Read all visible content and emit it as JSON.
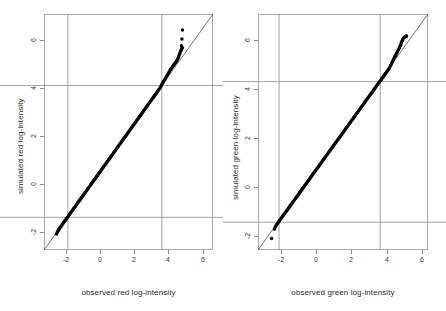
{
  "figure": {
    "width": 446,
    "height": 311,
    "background": "#ffffff",
    "point_color": "#000000",
    "line_color": "#000000",
    "box_color": "#a9a9a9",
    "reference_line_color": "#9a9a9a"
  },
  "chart_data": [
    {
      "type": "scatter",
      "name": "red-qq-plot",
      "title": "",
      "xlabel": "observed red log-intensity",
      "ylabel": "simulated red log-intensity",
      "grid": false,
      "legend": "none",
      "xlim": [
        -2.75,
        7.15
      ],
      "ylim": [
        -2.75,
        7.15
      ],
      "xticks": [
        -2,
        0,
        2,
        4,
        6
      ],
      "yticks": [
        -2,
        0,
        2,
        4,
        6
      ],
      "xticklabels": [
        "-2",
        "0",
        "2",
        "4",
        "6"
      ],
      "yticklabels": [
        "-2",
        "0",
        "2",
        "4",
        "6"
      ],
      "annotations": {
        "identity_line": {
          "from": [
            -2.75,
            -2.75
          ],
          "to": [
            7.15,
            7.15
          ],
          "style": "thin solid"
        },
        "reference_vlines": [
          -1.35,
          4.15
        ],
        "reference_hlines": [
          -1.38,
          4.15
        ]
      },
      "x": [
        -2.02,
        -1.98,
        -1.95,
        -1.92,
        -1.89,
        -1.86,
        -1.83,
        -1.8,
        -1.77,
        -1.74,
        -1.7,
        -1.66,
        -1.62,
        -1.58,
        -1.54,
        -1.5,
        -1.46,
        -1.42,
        -1.38,
        -1.34,
        -1.3,
        -1.26,
        -1.22,
        -1.18,
        -1.14,
        -1.1,
        -1.06,
        -1.02,
        -0.98,
        -0.94,
        -0.9,
        -0.86,
        -0.82,
        -0.78,
        -0.74,
        -0.7,
        -0.66,
        -0.62,
        -0.58,
        -0.54,
        -0.5,
        -0.46,
        -0.42,
        -0.38,
        -0.34,
        -0.3,
        -0.26,
        -0.22,
        -0.18,
        -0.14,
        -0.1,
        -0.06,
        -0.02,
        0.02,
        0.06,
        0.1,
        0.14,
        0.18,
        0.22,
        0.26,
        0.3,
        0.34,
        0.38,
        0.42,
        0.46,
        0.5,
        0.54,
        0.58,
        0.62,
        0.66,
        0.7,
        0.74,
        0.78,
        0.82,
        0.86,
        0.9,
        0.94,
        0.98,
        1.02,
        1.06,
        1.1,
        1.14,
        1.18,
        1.22,
        1.26,
        1.3,
        1.34,
        1.38,
        1.42,
        1.46,
        1.5,
        1.54,
        1.58,
        1.62,
        1.66,
        1.7,
        1.74,
        1.78,
        1.82,
        1.86,
        1.9,
        1.94,
        1.98,
        2.02,
        2.06,
        2.1,
        2.14,
        2.18,
        2.22,
        2.26,
        2.3,
        2.34,
        2.38,
        2.42,
        2.46,
        2.5,
        2.54,
        2.58,
        2.62,
        2.66,
        2.7,
        2.74,
        2.78,
        2.82,
        2.86,
        2.9,
        2.94,
        2.98,
        3.02,
        3.06,
        3.1,
        3.14,
        3.18,
        3.22,
        3.26,
        3.3,
        3.34,
        3.38,
        3.42,
        3.46,
        3.5,
        3.54,
        3.58,
        3.62,
        3.66,
        3.7,
        3.74,
        3.78,
        3.82,
        3.86,
        3.9,
        3.94,
        3.98,
        4.02,
        4.06,
        4.1,
        4.14,
        4.18,
        4.22,
        4.26,
        4.3,
        4.34,
        4.38,
        4.42,
        4.46,
        4.5,
        4.54,
        4.58,
        4.62,
        4.66,
        4.7,
        4.74,
        4.78,
        4.82,
        4.86,
        4.9,
        4.94,
        4.98,
        5.02,
        5.06,
        5.1,
        5.13,
        5.16,
        5.19,
        5.22,
        5.25,
        5.28,
        5.31,
        5.34,
        5.36,
        5.3,
        5.33,
        5.36
      ],
      "y": [
        -2.08,
        -2.02,
        -1.98,
        -1.94,
        -1.9,
        -1.86,
        -1.83,
        -1.8,
        -1.77,
        -1.74,
        -1.7,
        -1.66,
        -1.62,
        -1.58,
        -1.54,
        -1.5,
        -1.46,
        -1.42,
        -1.38,
        -1.34,
        -1.3,
        -1.26,
        -1.22,
        -1.18,
        -1.14,
        -1.1,
        -1.06,
        -1.02,
        -0.98,
        -0.94,
        -0.9,
        -0.86,
        -0.82,
        -0.78,
        -0.74,
        -0.7,
        -0.66,
        -0.62,
        -0.58,
        -0.54,
        -0.5,
        -0.46,
        -0.42,
        -0.38,
        -0.34,
        -0.3,
        -0.26,
        -0.22,
        -0.18,
        -0.14,
        -0.1,
        -0.06,
        -0.02,
        0.02,
        0.06,
        0.1,
        0.14,
        0.18,
        0.22,
        0.26,
        0.3,
        0.34,
        0.38,
        0.42,
        0.46,
        0.5,
        0.54,
        0.58,
        0.62,
        0.66,
        0.7,
        0.74,
        0.78,
        0.82,
        0.86,
        0.9,
        0.94,
        0.98,
        1.02,
        1.06,
        1.1,
        1.14,
        1.18,
        1.22,
        1.26,
        1.3,
        1.34,
        1.38,
        1.42,
        1.46,
        1.5,
        1.54,
        1.58,
        1.62,
        1.66,
        1.7,
        1.74,
        1.78,
        1.82,
        1.86,
        1.9,
        1.94,
        1.98,
        2.02,
        2.06,
        2.1,
        2.14,
        2.18,
        2.22,
        2.26,
        2.3,
        2.34,
        2.38,
        2.42,
        2.46,
        2.5,
        2.54,
        2.58,
        2.62,
        2.66,
        2.7,
        2.74,
        2.78,
        2.82,
        2.86,
        2.9,
        2.94,
        2.98,
        3.02,
        3.06,
        3.1,
        3.14,
        3.18,
        3.22,
        3.26,
        3.3,
        3.34,
        3.38,
        3.42,
        3.46,
        3.5,
        3.54,
        3.58,
        3.62,
        3.66,
        3.7,
        3.74,
        3.78,
        3.82,
        3.86,
        3.9,
        3.94,
        3.98,
        4.02,
        4.07,
        4.12,
        4.17,
        4.22,
        4.27,
        4.32,
        4.37,
        4.42,
        4.47,
        4.52,
        4.57,
        4.62,
        4.67,
        4.72,
        4.77,
        4.82,
        4.86,
        4.9,
        4.94,
        4.98,
        5.02,
        5.06,
        5.1,
        5.14,
        5.18,
        5.22,
        5.28,
        5.34,
        5.4,
        5.46,
        5.52,
        5.58,
        5.63,
        5.68,
        5.72,
        5.74,
        5.82,
        6.1,
        6.48
      ]
    },
    {
      "type": "scatter",
      "name": "green-qq-plot",
      "title": "",
      "xlabel": "observed green log-intensity",
      "ylabel": "simulated green log-intensity",
      "grid": false,
      "legend": "none",
      "xlim": [
        -2.55,
        7.05
      ],
      "ylim": [
        -2.55,
        7.05
      ],
      "xticks": [
        -2,
        0,
        2,
        4,
        6
      ],
      "yticks": [
        -2,
        0,
        2,
        4,
        6
      ],
      "xticklabels": [
        "-2",
        "0",
        "2",
        "4",
        "6"
      ],
      "yticklabels": [
        "-2",
        "0",
        "2",
        "4",
        "6"
      ],
      "annotations": {
        "identity_line": {
          "from": [
            -2.55,
            -2.55
          ],
          "to": [
            7.05,
            7.05
          ],
          "style": "thin solid"
        },
        "reference_vlines": [
          -1.36,
          4.35
        ],
        "reference_hlines": [
          -1.42,
          4.3
        ]
      },
      "x": [
        -1.78,
        -1.62,
        -1.58,
        -1.54,
        -1.5,
        -1.46,
        -1.42,
        -1.38,
        -1.34,
        -1.3,
        -1.26,
        -1.22,
        -1.18,
        -1.14,
        -1.1,
        -1.06,
        -1.02,
        -0.98,
        -0.94,
        -0.9,
        -0.86,
        -0.82,
        -0.78,
        -0.74,
        -0.7,
        -0.66,
        -0.62,
        -0.58,
        -0.54,
        -0.5,
        -0.46,
        -0.42,
        -0.38,
        -0.34,
        -0.3,
        -0.26,
        -0.22,
        -0.18,
        -0.14,
        -0.1,
        -0.06,
        -0.02,
        0.02,
        0.06,
        0.1,
        0.14,
        0.18,
        0.22,
        0.26,
        0.3,
        0.34,
        0.38,
        0.42,
        0.46,
        0.5,
        0.54,
        0.58,
        0.62,
        0.66,
        0.7,
        0.74,
        0.78,
        0.82,
        0.86,
        0.9,
        0.94,
        0.98,
        1.02,
        1.06,
        1.1,
        1.14,
        1.18,
        1.22,
        1.26,
        1.3,
        1.34,
        1.38,
        1.42,
        1.46,
        1.5,
        1.54,
        1.58,
        1.62,
        1.66,
        1.7,
        1.74,
        1.78,
        1.82,
        1.86,
        1.9,
        1.94,
        1.98,
        2.02,
        2.06,
        2.1,
        2.14,
        2.18,
        2.22,
        2.26,
        2.3,
        2.34,
        2.38,
        2.42,
        2.46,
        2.5,
        2.54,
        2.58,
        2.62,
        2.66,
        2.7,
        2.74,
        2.78,
        2.82,
        2.86,
        2.9,
        2.94,
        2.98,
        3.02,
        3.06,
        3.1,
        3.14,
        3.18,
        3.22,
        3.26,
        3.3,
        3.34,
        3.38,
        3.42,
        3.46,
        3.5,
        3.54,
        3.58,
        3.62,
        3.66,
        3.7,
        3.74,
        3.78,
        3.82,
        3.86,
        3.9,
        3.94,
        3.98,
        4.02,
        4.06,
        4.1,
        4.14,
        4.18,
        4.22,
        4.26,
        4.3,
        4.34,
        4.38,
        4.42,
        4.46,
        4.5,
        4.54,
        4.58,
        4.62,
        4.66,
        4.7,
        4.74,
        4.78,
        4.82,
        4.86,
        4.9,
        4.94,
        4.98,
        5.02,
        5.06,
        5.1,
        5.14,
        5.18,
        5.22,
        5.26,
        5.3,
        5.34,
        5.38,
        5.42,
        5.46,
        5.5,
        5.54,
        5.58,
        5.62,
        5.66,
        5.7,
        5.74,
        5.78,
        5.8,
        5.82,
        5.84
      ],
      "y": [
        -2.08,
        -1.7,
        -1.62,
        -1.56,
        -1.52,
        -1.48,
        -1.44,
        -1.4,
        -1.36,
        -1.32,
        -1.28,
        -1.24,
        -1.2,
        -1.16,
        -1.12,
        -1.08,
        -1.04,
        -1.0,
        -0.96,
        -0.92,
        -0.88,
        -0.84,
        -0.8,
        -0.76,
        -0.72,
        -0.68,
        -0.64,
        -0.6,
        -0.56,
        -0.52,
        -0.48,
        -0.44,
        -0.4,
        -0.36,
        -0.32,
        -0.28,
        -0.24,
        -0.2,
        -0.16,
        -0.12,
        -0.08,
        -0.04,
        0.0,
        0.04,
        0.08,
        0.12,
        0.16,
        0.2,
        0.24,
        0.28,
        0.32,
        0.36,
        0.4,
        0.44,
        0.48,
        0.52,
        0.56,
        0.6,
        0.64,
        0.68,
        0.72,
        0.76,
        0.8,
        0.84,
        0.88,
        0.92,
        0.96,
        1.0,
        1.04,
        1.08,
        1.12,
        1.16,
        1.2,
        1.24,
        1.28,
        1.32,
        1.36,
        1.4,
        1.44,
        1.48,
        1.52,
        1.56,
        1.6,
        1.64,
        1.68,
        1.72,
        1.76,
        1.8,
        1.84,
        1.88,
        1.92,
        1.96,
        2.0,
        2.04,
        2.08,
        2.12,
        2.16,
        2.2,
        2.24,
        2.28,
        2.32,
        2.36,
        2.4,
        2.44,
        2.48,
        2.52,
        2.56,
        2.6,
        2.64,
        2.68,
        2.72,
        2.76,
        2.8,
        2.84,
        2.88,
        2.92,
        2.96,
        3.0,
        3.04,
        3.08,
        3.12,
        3.16,
        3.2,
        3.24,
        3.28,
        3.32,
        3.36,
        3.4,
        3.44,
        3.48,
        3.52,
        3.56,
        3.6,
        3.64,
        3.68,
        3.72,
        3.76,
        3.8,
        3.84,
        3.88,
        3.92,
        3.96,
        4.0,
        4.04,
        4.08,
        4.12,
        4.16,
        4.2,
        4.24,
        4.28,
        4.32,
        4.36,
        4.4,
        4.44,
        4.48,
        4.52,
        4.56,
        4.6,
        4.64,
        4.68,
        4.72,
        4.76,
        4.8,
        4.84,
        4.9,
        4.96,
        5.02,
        5.08,
        5.14,
        5.2,
        5.26,
        5.32,
        5.36,
        5.42,
        5.48,
        5.54,
        5.6,
        5.66,
        5.72,
        5.78,
        5.86,
        5.94,
        6.0,
        6.06,
        6.1,
        6.12,
        6.13,
        6.14,
        6.15,
        6.16
      ]
    }
  ]
}
